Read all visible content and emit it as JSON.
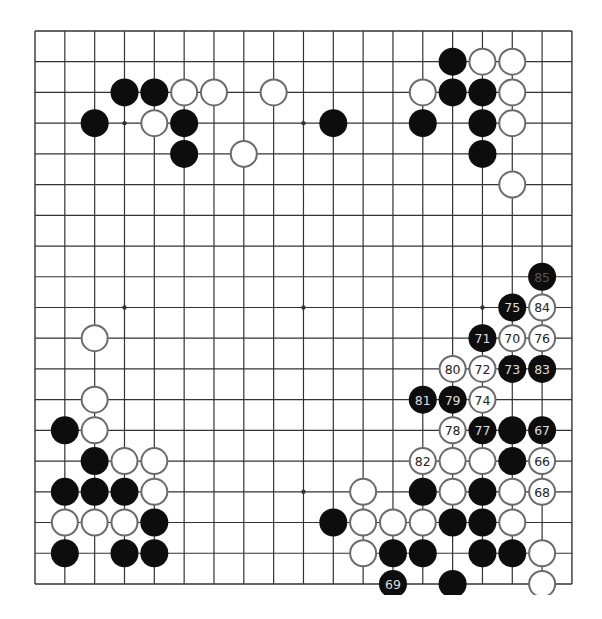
{
  "board": {
    "size": 19,
    "origin_x": 35,
    "origin_y": 31,
    "step_x": 29.83,
    "step_y": 30.72,
    "stone_radius": 14,
    "visible_clip_bottom": 595,
    "star_points": [
      [
        3,
        3
      ],
      [
        9,
        3
      ],
      [
        15,
        3
      ],
      [
        3,
        9
      ],
      [
        9,
        9
      ],
      [
        15,
        9
      ],
      [
        3,
        15
      ],
      [
        9,
        15
      ],
      [
        15,
        15
      ]
    ],
    "colors": {
      "line": "#333333",
      "black_stone": "#0d0d0d",
      "white_stone": "#ffffff",
      "white_stone_border": "#6b6b6b",
      "label_on_black": "#dddddd",
      "label_on_white": "#222222",
      "label_last_move": "#555555"
    }
  },
  "stones": [
    {
      "col": 3,
      "row": 2,
      "color": "black",
      "label": ""
    },
    {
      "col": 4,
      "row": 2,
      "color": "black",
      "label": ""
    },
    {
      "col": 5,
      "row": 2,
      "color": "white",
      "label": ""
    },
    {
      "col": 6,
      "row": 2,
      "color": "white",
      "label": ""
    },
    {
      "col": 8,
      "row": 2,
      "color": "white",
      "label": ""
    },
    {
      "col": 2,
      "row": 3,
      "color": "black",
      "label": ""
    },
    {
      "col": 4,
      "row": 3,
      "color": "white",
      "label": ""
    },
    {
      "col": 5,
      "row": 3,
      "color": "black",
      "label": ""
    },
    {
      "col": 5,
      "row": 4,
      "color": "black",
      "label": ""
    },
    {
      "col": 7,
      "row": 4,
      "color": "white",
      "label": ""
    },
    {
      "col": 10,
      "row": 3,
      "color": "black",
      "label": ""
    },
    {
      "col": 14,
      "row": 1,
      "color": "black",
      "label": ""
    },
    {
      "col": 15,
      "row": 1,
      "color": "white",
      "label": ""
    },
    {
      "col": 16,
      "row": 1,
      "color": "white",
      "label": ""
    },
    {
      "col": 13,
      "row": 2,
      "color": "white",
      "label": ""
    },
    {
      "col": 14,
      "row": 2,
      "color": "black",
      "label": ""
    },
    {
      "col": 15,
      "row": 2,
      "color": "black",
      "label": ""
    },
    {
      "col": 16,
      "row": 2,
      "color": "white",
      "label": ""
    },
    {
      "col": 13,
      "row": 3,
      "color": "black",
      "label": ""
    },
    {
      "col": 15,
      "row": 3,
      "color": "black",
      "label": ""
    },
    {
      "col": 16,
      "row": 3,
      "color": "white",
      "label": ""
    },
    {
      "col": 15,
      "row": 4,
      "color": "black",
      "label": ""
    },
    {
      "col": 16,
      "row": 5,
      "color": "white",
      "label": ""
    },
    {
      "col": 17,
      "row": 8,
      "color": "black",
      "label": "85",
      "last": true
    },
    {
      "col": 16,
      "row": 9,
      "color": "black",
      "label": "75"
    },
    {
      "col": 17,
      "row": 9,
      "color": "white",
      "label": "84"
    },
    {
      "col": 15,
      "row": 10,
      "color": "black",
      "label": "71"
    },
    {
      "col": 16,
      "row": 10,
      "color": "white",
      "label": "70"
    },
    {
      "col": 17,
      "row": 10,
      "color": "white",
      "label": "76"
    },
    {
      "col": 14,
      "row": 11,
      "color": "white",
      "label": "80"
    },
    {
      "col": 15,
      "row": 11,
      "color": "white",
      "label": "72"
    },
    {
      "col": 16,
      "row": 11,
      "color": "black",
      "label": "73"
    },
    {
      "col": 17,
      "row": 11,
      "color": "black",
      "label": "83"
    },
    {
      "col": 13,
      "row": 12,
      "color": "black",
      "label": "81"
    },
    {
      "col": 14,
      "row": 12,
      "color": "black",
      "label": "79"
    },
    {
      "col": 15,
      "row": 12,
      "color": "white",
      "label": "74"
    },
    {
      "col": 14,
      "row": 13,
      "color": "white",
      "label": "78"
    },
    {
      "col": 15,
      "row": 13,
      "color": "black",
      "label": "77"
    },
    {
      "col": 16,
      "row": 13,
      "color": "black",
      "label": ""
    },
    {
      "col": 17,
      "row": 13,
      "color": "black",
      "label": "67"
    },
    {
      "col": 13,
      "row": 14,
      "color": "white",
      "label": "82"
    },
    {
      "col": 14,
      "row": 14,
      "color": "white",
      "label": ""
    },
    {
      "col": 15,
      "row": 14,
      "color": "white",
      "label": ""
    },
    {
      "col": 16,
      "row": 14,
      "color": "black",
      "label": ""
    },
    {
      "col": 17,
      "row": 14,
      "color": "white",
      "label": "66"
    },
    {
      "col": 11,
      "row": 15,
      "color": "white",
      "label": ""
    },
    {
      "col": 13,
      "row": 15,
      "color": "black",
      "label": ""
    },
    {
      "col": 14,
      "row": 15,
      "color": "white",
      "label": ""
    },
    {
      "col": 15,
      "row": 15,
      "color": "black",
      "label": ""
    },
    {
      "col": 16,
      "row": 15,
      "color": "white",
      "label": ""
    },
    {
      "col": 17,
      "row": 15,
      "color": "white",
      "label": "68"
    },
    {
      "col": 10,
      "row": 16,
      "color": "black",
      "label": ""
    },
    {
      "col": 11,
      "row": 16,
      "color": "white",
      "label": ""
    },
    {
      "col": 12,
      "row": 16,
      "color": "white",
      "label": ""
    },
    {
      "col": 13,
      "row": 16,
      "color": "white",
      "label": ""
    },
    {
      "col": 14,
      "row": 16,
      "color": "black",
      "label": ""
    },
    {
      "col": 15,
      "row": 16,
      "color": "black",
      "label": ""
    },
    {
      "col": 16,
      "row": 16,
      "color": "white",
      "label": ""
    },
    {
      "col": 11,
      "row": 17,
      "color": "white",
      "label": ""
    },
    {
      "col": 12,
      "row": 17,
      "color": "black",
      "label": ""
    },
    {
      "col": 13,
      "row": 17,
      "color": "black",
      "label": ""
    },
    {
      "col": 15,
      "row": 17,
      "color": "black",
      "label": ""
    },
    {
      "col": 16,
      "row": 17,
      "color": "black",
      "label": ""
    },
    {
      "col": 17,
      "row": 17,
      "color": "white",
      "label": ""
    },
    {
      "col": 12,
      "row": 18,
      "color": "black",
      "label": "69"
    },
    {
      "col": 14,
      "row": 18,
      "color": "black",
      "label": ""
    },
    {
      "col": 17,
      "row": 18,
      "color": "white",
      "label": ""
    },
    {
      "col": 2,
      "row": 10,
      "color": "white",
      "label": ""
    },
    {
      "col": 2,
      "row": 12,
      "color": "white",
      "label": ""
    },
    {
      "col": 1,
      "row": 13,
      "color": "black",
      "label": ""
    },
    {
      "col": 2,
      "row": 13,
      "color": "white",
      "label": ""
    },
    {
      "col": 2,
      "row": 14,
      "color": "black",
      "label": ""
    },
    {
      "col": 3,
      "row": 14,
      "color": "white",
      "label": ""
    },
    {
      "col": 4,
      "row": 14,
      "color": "white",
      "label": ""
    },
    {
      "col": 1,
      "row": 15,
      "color": "black",
      "label": ""
    },
    {
      "col": 2,
      "row": 15,
      "color": "black",
      "label": ""
    },
    {
      "col": 3,
      "row": 15,
      "color": "black",
      "label": ""
    },
    {
      "col": 4,
      "row": 15,
      "color": "white",
      "label": ""
    },
    {
      "col": 1,
      "row": 16,
      "color": "white",
      "label": ""
    },
    {
      "col": 2,
      "row": 16,
      "color": "white",
      "label": ""
    },
    {
      "col": 3,
      "row": 16,
      "color": "white",
      "label": ""
    },
    {
      "col": 4,
      "row": 16,
      "color": "black",
      "label": ""
    },
    {
      "col": 1,
      "row": 17,
      "color": "black",
      "label": ""
    },
    {
      "col": 3,
      "row": 17,
      "color": "black",
      "label": ""
    },
    {
      "col": 4,
      "row": 17,
      "color": "black",
      "label": ""
    }
  ]
}
